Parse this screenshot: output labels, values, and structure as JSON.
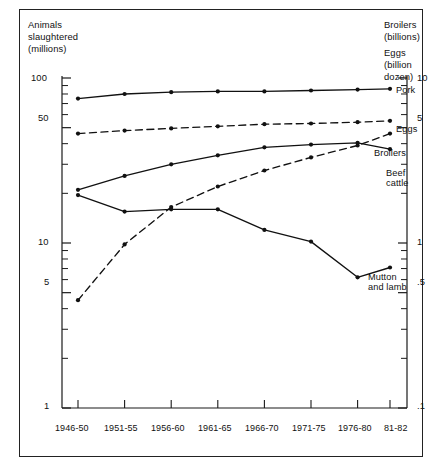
{
  "figure": {
    "background": "#ffffff",
    "frame_color": "#222222",
    "axis_color": "#1a1a1a"
  },
  "axis_titles": {
    "left": [
      "Animals",
      "slaughtered",
      "(millions)"
    ],
    "right": [
      "Broilers",
      "(billions)",
      "Eggs",
      "(billion",
      "dozen)"
    ]
  },
  "left_axis": {
    "major_labels": [
      "100",
      "50",
      "10",
      "5",
      "1"
    ],
    "major_values": [
      100,
      50,
      10,
      5,
      1
    ],
    "scale": "log",
    "range": [
      1,
      100
    ]
  },
  "right_axis": {
    "major_labels": [
      "10",
      "5",
      "1",
      ".5",
      ".1"
    ],
    "major_values": [
      10,
      5,
      1,
      0.5,
      0.1
    ],
    "scale": "log",
    "range": [
      0.1,
      10
    ]
  },
  "x_axis": {
    "categories": [
      "1946-50",
      "1951-55",
      "1956-60",
      "1961-65",
      "1966-70",
      "1971-75",
      "1976-80",
      "81-82"
    ]
  },
  "series_labels": {
    "pork": "Pork",
    "eggs": "Eggs",
    "broilers": "Broilers",
    "beef_cattle": [
      "Beef",
      "cattle"
    ],
    "mutton_and_lamb": [
      "Mutton",
      "and lamb"
    ]
  },
  "chart_data": {
    "type": "line",
    "title": "",
    "xlabel": "",
    "ylabel": "Animals slaughtered (millions)",
    "y2label": "Broilers (billions) / Eggs (billion dozen)",
    "yscale": "log",
    "ylim": [
      1,
      100
    ],
    "y2lim": [
      0.1,
      10
    ],
    "grid": false,
    "legend": "inline-right-labels",
    "categories": [
      "1946-50",
      "1951-55",
      "1956-60",
      "1961-65",
      "1966-70",
      "1971-75",
      "1976-80",
      "81-82"
    ],
    "series": [
      {
        "name": "Pork",
        "axis": "left",
        "style": "solid",
        "units": "millions",
        "values": [
          75,
          80,
          82,
          83,
          83,
          84,
          85,
          86
        ]
      },
      {
        "name": "Eggs",
        "axis": "right",
        "style": "dashed",
        "units": "billion dozen",
        "values": [
          4.6,
          4.8,
          4.95,
          5.1,
          5.25,
          5.3,
          5.4,
          5.5
        ]
      },
      {
        "name": "Broilers",
        "axis": "right",
        "style": "dashed",
        "units": "billions",
        "values": [
          0.45,
          0.98,
          1.65,
          2.2,
          2.75,
          3.3,
          3.9,
          4.6
        ]
      },
      {
        "name": "Beef cattle",
        "axis": "left",
        "style": "solid",
        "units": "millions",
        "values": [
          21,
          25.5,
          30,
          34,
          38,
          39.5,
          40.5,
          37
        ]
      },
      {
        "name": "Mutton and lamb",
        "axis": "left",
        "style": "solid",
        "units": "millions",
        "values": [
          19.5,
          15.5,
          16,
          16,
          12,
          10.2,
          6.2,
          7.1
        ]
      }
    ]
  }
}
